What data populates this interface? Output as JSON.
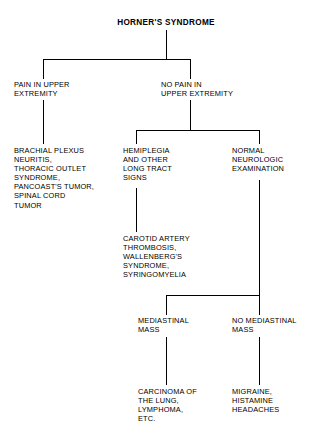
{
  "diagram": {
    "title": "HORNER'S SYNDROME",
    "type": "flowchart",
    "orientation": "top-down",
    "line_color": "#000000",
    "background_color": "#ffffff",
    "text_color": "#000000",
    "nodes": {
      "root": "HORNER'S SYNDROME",
      "pain_upper_extremity": "PAIN IN UPPER\nEXTREMITY",
      "no_pain_upper_extremity": "NO PAIN IN\nUPPER EXTREMITY",
      "brachial_plexus": "BRACHIAL PLEXUS\nNEURITIS,\nTHORACIC OUTLET\nSYNDROME,\nPANCOAST'S TUMOR,\nSPINAL CORD\nTUMOR",
      "hemiplegia": "HEMIPLEGIA\nAND OTHER\nLONG TRACT\nSIGNS",
      "normal_neurologic": "NORMAL\nNEUROLOGIC\nEXAMINATION",
      "carotid_artery": "CAROTID ARTERY\nTHROMBOSIS,\nWALLENBERG'S\nSYNDROME,\nSYRINGOMYELIA",
      "mediastinal_mass": "MEDIASTINAL\nMASS",
      "no_mediastinal_mass": "NO MEDIASTINAL\nMASS",
      "carcinoma_lung": "CARCINOMA OF\nTHE LUNG,\nLYMPHOMA,\nETC.",
      "migraine": "MIGRAINE,\nHISTAMINE\nHEADACHES"
    }
  }
}
